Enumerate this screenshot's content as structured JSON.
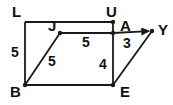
{
  "figure": {
    "kind": "geometry-diagram",
    "stroke_color": "#1a1a1a",
    "background_color": "#ffffff",
    "text_color": "#111111",
    "vertices": [
      {
        "id": "L",
        "label": "L",
        "x": 25,
        "y": 22,
        "label_x": 12,
        "label_y": 4,
        "dot": false
      },
      {
        "id": "U",
        "label": "U",
        "x": 113,
        "y": 22,
        "label_x": 106,
        "label_y": 4,
        "dot": true
      },
      {
        "id": "A",
        "label": "A",
        "x": 113,
        "y": 33,
        "label_x": 120,
        "label_y": 18,
        "dot": true
      },
      {
        "id": "J",
        "label": "J",
        "x": 60,
        "y": 33,
        "label_x": 48,
        "label_y": 18,
        "dot": true
      },
      {
        "id": "Y",
        "label": "Y",
        "x": 152,
        "y": 31,
        "label_x": 158,
        "label_y": 22,
        "dot": true
      },
      {
        "id": "B",
        "label": "B",
        "x": 25,
        "y": 85,
        "label_x": 10,
        "label_y": 84,
        "dot": true
      },
      {
        "id": "E",
        "label": "E",
        "x": 113,
        "y": 85,
        "label_x": 120,
        "label_y": 84,
        "dot": true
      }
    ],
    "edges": [
      {
        "id": "LU",
        "from": "L",
        "to": "U",
        "arrow": false
      },
      {
        "id": "LB",
        "from": "L",
        "to": "B",
        "arrow": false
      },
      {
        "id": "BE",
        "from": "B",
        "to": "E",
        "arrow": false
      },
      {
        "id": "UE",
        "from": "U",
        "to": "E",
        "arrow": false
      },
      {
        "id": "JA",
        "from": "J",
        "to": "A",
        "arrow": false
      },
      {
        "id": "JB",
        "from": "J",
        "to": "B",
        "arrow": false
      },
      {
        "id": "AY",
        "from": "A",
        "to": "Y",
        "arrow": true
      },
      {
        "id": "EY",
        "from": "E",
        "to": "Y",
        "arrow": false
      }
    ],
    "measurements": [
      {
        "id": "m-LB",
        "value": "5",
        "x": 11,
        "y": 45,
        "segment": "LB"
      },
      {
        "id": "m-JB",
        "value": "5",
        "x": 48,
        "y": 54,
        "segment": "JB"
      },
      {
        "id": "m-JA",
        "value": "5",
        "x": 82,
        "y": 35,
        "segment": "JA"
      },
      {
        "id": "m-AE",
        "value": "4",
        "x": 99,
        "y": 57,
        "segment": "AE"
      },
      {
        "id": "m-AY",
        "value": "3",
        "x": 123,
        "y": 36,
        "segment": "AY"
      }
    ]
  }
}
